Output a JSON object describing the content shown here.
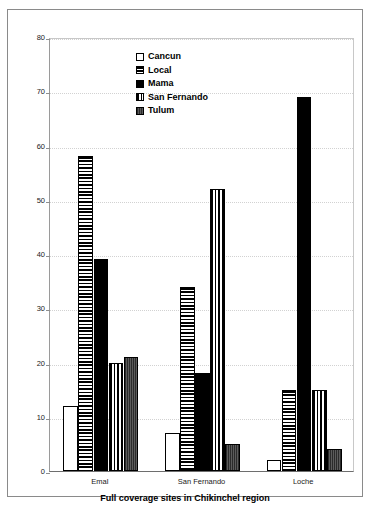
{
  "chart_data": {
    "type": "bar",
    "title": "Full coverage sites in Chikinchel region",
    "xlabel": "Full coverage sites in Chikinchel region",
    "ylabel": "",
    "categories": [
      "Emal",
      "San Fernando",
      "Loche"
    ],
    "series": [
      {
        "name": "Cancun",
        "values": [
          12,
          7,
          2
        ],
        "fill": "empty-white"
      },
      {
        "name": "Local",
        "values": [
          58,
          34,
          15
        ],
        "fill": "horizontal-stripes"
      },
      {
        "name": "Mama",
        "values": [
          39,
          18,
          69
        ],
        "fill": "solid-black"
      },
      {
        "name": "San Fernando",
        "values": [
          20,
          52,
          15
        ],
        "fill": "vertical-stripes"
      },
      {
        "name": "Tulum",
        "values": [
          21,
          5,
          4
        ],
        "fill": "dark-gray-dense"
      }
    ],
    "ylim": [
      0,
      80
    ],
    "yticks": [
      0,
      10,
      20,
      30,
      40,
      50,
      60,
      70,
      80
    ],
    "ytick_labels": [
      "0",
      "10",
      "20",
      "30",
      "40",
      "50",
      "60",
      "70",
      "80"
    ],
    "grid": true,
    "legend_position": "top-center"
  },
  "legend": {
    "items": [
      {
        "label": "Cancun",
        "swatch": "legend-swatch-cancun"
      },
      {
        "label": "Local",
        "swatch": "legend-swatch-local"
      },
      {
        "label": "Mama",
        "swatch": "legend-swatch-mama"
      },
      {
        "label": "San Fernando",
        "swatch": "legend-swatch-san-fernando"
      },
      {
        "label": "Tulum",
        "swatch": "legend-swatch-tulum"
      }
    ]
  },
  "colors": {
    "frame_border": "#8a8a8a",
    "axis": "#6e6e6e",
    "gridline": "#d2d2d2",
    "bar_outline": "#000000",
    "solid_fill": "#000000",
    "gray_fill": "#4a4a4a",
    "background": "#ffffff",
    "text": "#000000"
  }
}
